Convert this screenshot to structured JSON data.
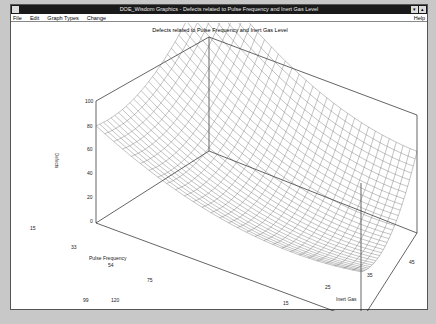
{
  "window": {
    "title": "DOE_Wisdom Graphics - Defects related to Pulse Frequency and Inert Gas Level",
    "controls": [
      "minimize",
      "maximize"
    ]
  },
  "menubar": {
    "items": [
      "File",
      "Edit",
      "Graph Types",
      "Change"
    ],
    "help": "Help"
  },
  "chart_data": {
    "type": "surface3d",
    "title": "Defects related to Pulse Frequency and Inert Gas Level",
    "xlabel": "Pulse Frequency",
    "ylabel": "Inert Gas",
    "zlabel": "Defects",
    "x_ticks": [
      15,
      33,
      54,
      75,
      99,
      120
    ],
    "y_ticks": [
      5,
      15,
      25,
      35,
      45
    ],
    "z_ticks": [
      0,
      20,
      40,
      60,
      80,
      100
    ],
    "xlim": [
      15,
      120
    ],
    "ylim": [
      5,
      50
    ],
    "zlim": [
      0,
      100
    ],
    "surface_description": "Bowl-shaped (quadratic) wireframe surface with minimum near center; highest (~100) at corner Pulse Frequency=15, Inert Gas=50; ~80 at PF=15, IG=5; ~75 at PF=120, IG=50; minimum ~25 near PF=90, IG=20",
    "corner_values": [
      {
        "x": 15,
        "y": 5,
        "z": 80
      },
      {
        "x": 15,
        "y": 50,
        "z": 100
      },
      {
        "x": 120,
        "y": 50,
        "z": 75
      },
      {
        "x": 120,
        "y": 5,
        "z": 50
      }
    ],
    "grid": false,
    "legend": "none"
  }
}
